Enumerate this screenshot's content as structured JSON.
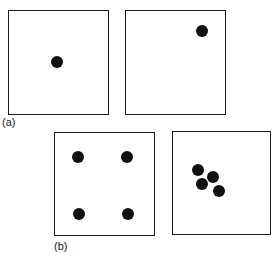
{
  "panels": [
    {
      "id": "a",
      "label": "(a)",
      "label_pos": [
        2,
        116
      ],
      "boxes": [
        {
          "rect": [
            8,
            10,
            101,
            105
          ],
          "dots": [
            [
              57,
              62
            ]
          ]
        },
        {
          "rect": [
            125,
            10,
            101,
            105
          ],
          "dots": [
            [
              202,
              31
            ]
          ]
        }
      ]
    },
    {
      "id": "b",
      "label": "(b)",
      "label_pos": [
        54,
        240
      ],
      "boxes": [
        {
          "rect": [
            54,
            132,
            101,
            104
          ],
          "dots": [
            [
              78,
              157
            ],
            [
              127,
              157
            ],
            [
              79,
              214
            ],
            [
              128,
              214
            ]
          ]
        },
        {
          "rect": [
            172,
            131,
            99,
            104
          ],
          "dots": [
            [
              198,
              170
            ],
            [
              213,
              177
            ],
            [
              202,
              184
            ],
            [
              219,
              191
            ]
          ]
        }
      ]
    }
  ],
  "colors": {
    "dot": "#111111",
    "border": "#1a1a1a"
  }
}
